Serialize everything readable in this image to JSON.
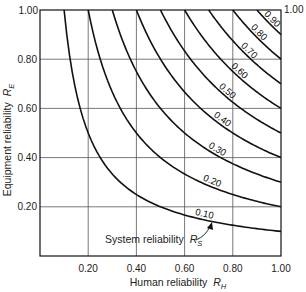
{
  "chart_data": {
    "type": "line",
    "subtype": "contour",
    "title": "",
    "xlabel": "Human reliability R_H",
    "ylabel": "Equipment reliability R_E",
    "xlabel_text": "Human reliability",
    "xlabel_symbol": "R",
    "xlabel_sub": "H",
    "ylabel_text": "Equipment reliability",
    "ylabel_symbol": "R",
    "ylabel_sub": "E",
    "xlim": [
      0,
      1.0
    ],
    "ylim": [
      0,
      1.0
    ],
    "xticks": [
      "0.20",
      "0.40",
      "0.60",
      "0.80",
      "1.00"
    ],
    "yticks": [
      "0.20",
      "0.40",
      "0.60",
      "0.80",
      "1.00"
    ],
    "xtick_values": [
      0.2,
      0.4,
      0.6,
      0.8,
      1.0
    ],
    "ytick_values": [
      0.2,
      0.4,
      0.6,
      0.8,
      1.0
    ],
    "grid": true,
    "relation": "R_S = R_H * R_E",
    "series": [
      {
        "name": "0.10",
        "value": 0.1
      },
      {
        "name": "0.20",
        "value": 0.2
      },
      {
        "name": "0.30",
        "value": 0.3
      },
      {
        "name": "0.40",
        "value": 0.4
      },
      {
        "name": "0.50",
        "value": 0.5
      },
      {
        "name": "0.60",
        "value": 0.6
      },
      {
        "name": "0.70",
        "value": 0.7
      },
      {
        "name": "0.80",
        "value": 0.8
      },
      {
        "name": "0.90",
        "value": 0.9
      }
    ],
    "annotation": {
      "text": "System reliability",
      "symbol": "R",
      "sub": "S",
      "points_to": "0.10"
    }
  }
}
